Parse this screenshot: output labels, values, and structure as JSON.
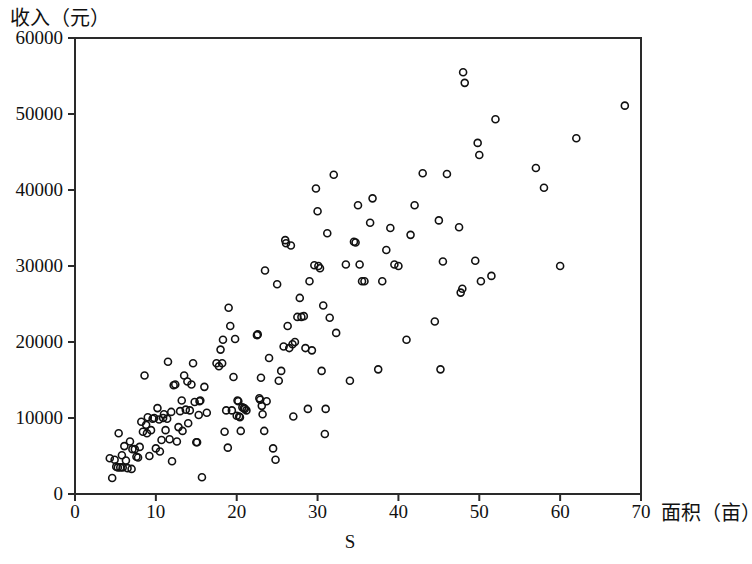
{
  "chart_data": {
    "type": "scatter",
    "title": "",
    "subtitle": "",
    "xlabel": "面积（亩）",
    "ylabel": "收入（元）",
    "series_label": "S",
    "xlim": [
      0,
      70
    ],
    "ylim": [
      0,
      60000
    ],
    "xticks": [
      0,
      10,
      20,
      30,
      40,
      50,
      60,
      70
    ],
    "yticks": [
      0,
      10000,
      20000,
      30000,
      40000,
      50000,
      60000
    ],
    "xtick_labels": [
      "0",
      "10",
      "20",
      "30",
      "40",
      "50",
      "60",
      "70"
    ],
    "ytick_labels": [
      "0",
      "10000",
      "20000",
      "30000",
      "40000",
      "50000",
      "60000"
    ],
    "grid": false,
    "legend": null,
    "marker": "open-circle",
    "marker_color": "#111111",
    "marker_size": 7,
    "n_points": 196,
    "points": [
      [
        4.3,
        4700
      ],
      [
        4.6,
        2100
      ],
      [
        4.9,
        4500
      ],
      [
        5.1,
        3600
      ],
      [
        5.3,
        3500
      ],
      [
        5.4,
        8000
      ],
      [
        5.6,
        3500
      ],
      [
        5.8,
        5100
      ],
      [
        5.9,
        3500
      ],
      [
        6.1,
        6300
      ],
      [
        6.3,
        4400
      ],
      [
        6.5,
        3400
      ],
      [
        6.8,
        6900
      ],
      [
        7.0,
        3300
      ],
      [
        7.1,
        5900
      ],
      [
        7.4,
        5900
      ],
      [
        7.6,
        4900
      ],
      [
        7.8,
        4800
      ],
      [
        8.0,
        6200
      ],
      [
        8.2,
        9500
      ],
      [
        8.4,
        8200
      ],
      [
        8.6,
        15600
      ],
      [
        8.8,
        9100
      ],
      [
        8.9,
        8000
      ],
      [
        9.0,
        10100
      ],
      [
        9.2,
        5000
      ],
      [
        9.4,
        8400
      ],
      [
        9.6,
        9900
      ],
      [
        9.8,
        10000
      ],
      [
        10.0,
        6000
      ],
      [
        10.2,
        11300
      ],
      [
        10.4,
        9800
      ],
      [
        10.5,
        5600
      ],
      [
        10.7,
        7100
      ],
      [
        10.9,
        10000
      ],
      [
        11.0,
        10500
      ],
      [
        11.2,
        8400
      ],
      [
        11.4,
        9900
      ],
      [
        11.5,
        17400
      ],
      [
        11.7,
        7200
      ],
      [
        11.9,
        10800
      ],
      [
        12.0,
        4300
      ],
      [
        12.2,
        14300
      ],
      [
        12.4,
        14400
      ],
      [
        12.6,
        6900
      ],
      [
        12.8,
        8800
      ],
      [
        13.0,
        10900
      ],
      [
        13.2,
        12300
      ],
      [
        13.3,
        8300
      ],
      [
        13.5,
        15600
      ],
      [
        13.7,
        11100
      ],
      [
        13.9,
        14800
      ],
      [
        14.0,
        9300
      ],
      [
        14.2,
        11000
      ],
      [
        14.4,
        14400
      ],
      [
        14.6,
        17200
      ],
      [
        14.8,
        12100
      ],
      [
        15.0,
        6800
      ],
      [
        15.1,
        6800
      ],
      [
        15.3,
        10400
      ],
      [
        15.4,
        12200
      ],
      [
        15.5,
        12300
      ],
      [
        15.7,
        2200
      ],
      [
        16.0,
        14100
      ],
      [
        16.3,
        10700
      ],
      [
        17.5,
        17200
      ],
      [
        17.8,
        16800
      ],
      [
        18.0,
        19000
      ],
      [
        18.2,
        17200
      ],
      [
        18.3,
        20300
      ],
      [
        18.5,
        8200
      ],
      [
        18.7,
        11000
      ],
      [
        18.9,
        6100
      ],
      [
        19.0,
        24500
      ],
      [
        19.2,
        22100
      ],
      [
        19.4,
        11000
      ],
      [
        19.6,
        15400
      ],
      [
        19.8,
        20400
      ],
      [
        20.0,
        10300
      ],
      [
        20.1,
        12300
      ],
      [
        20.2,
        12200
      ],
      [
        20.3,
        10200
      ],
      [
        20.4,
        10100
      ],
      [
        20.5,
        8300
      ],
      [
        20.7,
        11400
      ],
      [
        20.9,
        11300
      ],
      [
        21.0,
        11200
      ],
      [
        21.2,
        11000
      ],
      [
        22.5,
        20900
      ],
      [
        22.6,
        21000
      ],
      [
        22.8,
        12600
      ],
      [
        22.9,
        12400
      ],
      [
        23.0,
        15300
      ],
      [
        23.1,
        11600
      ],
      [
        23.2,
        10500
      ],
      [
        23.4,
        8300
      ],
      [
        23.5,
        29400
      ],
      [
        23.7,
        12200
      ],
      [
        24.0,
        17900
      ],
      [
        24.5,
        6000
      ],
      [
        24.8,
        4500
      ],
      [
        25.0,
        27600
      ],
      [
        25.2,
        14900
      ],
      [
        25.5,
        16200
      ],
      [
        25.8,
        19400
      ],
      [
        26.0,
        33400
      ],
      [
        26.1,
        33000
      ],
      [
        26.3,
        22100
      ],
      [
        26.5,
        19200
      ],
      [
        26.7,
        32700
      ],
      [
        26.9,
        19700
      ],
      [
        27.0,
        10200
      ],
      [
        27.2,
        20000
      ],
      [
        27.5,
        23300
      ],
      [
        27.8,
        25800
      ],
      [
        28.0,
        23300
      ],
      [
        28.3,
        23400
      ],
      [
        28.5,
        19200
      ],
      [
        28.8,
        11200
      ],
      [
        29.0,
        28000
      ],
      [
        29.3,
        18900
      ],
      [
        29.6,
        30100
      ],
      [
        29.8,
        40200
      ],
      [
        30.0,
        37200
      ],
      [
        30.1,
        30000
      ],
      [
        30.3,
        29700
      ],
      [
        30.5,
        16200
      ],
      [
        30.7,
        24800
      ],
      [
        30.9,
        7900
      ],
      [
        31.0,
        11200
      ],
      [
        31.2,
        34300
      ],
      [
        31.5,
        23200
      ],
      [
        32.0,
        42000
      ],
      [
        32.3,
        21200
      ],
      [
        33.5,
        30200
      ],
      [
        34.0,
        14900
      ],
      [
        34.5,
        33200
      ],
      [
        34.7,
        33100
      ],
      [
        35.0,
        38000
      ],
      [
        35.2,
        30200
      ],
      [
        35.5,
        28000
      ],
      [
        35.8,
        28000
      ],
      [
        36.5,
        35700
      ],
      [
        36.8,
        38900
      ],
      [
        37.5,
        16400
      ],
      [
        38.0,
        28000
      ],
      [
        38.5,
        32100
      ],
      [
        39.0,
        35000
      ],
      [
        39.5,
        30200
      ],
      [
        40.0,
        30000
      ],
      [
        41.0,
        20300
      ],
      [
        41.5,
        34100
      ],
      [
        42.0,
        38000
      ],
      [
        43.0,
        42200
      ],
      [
        44.5,
        22700
      ],
      [
        45.0,
        36000
      ],
      [
        45.2,
        16400
      ],
      [
        45.5,
        30600
      ],
      [
        46.0,
        42100
      ],
      [
        47.5,
        35100
      ],
      [
        47.7,
        26500
      ],
      [
        47.9,
        27000
      ],
      [
        48.0,
        55500
      ],
      [
        48.2,
        54100
      ],
      [
        49.5,
        30700
      ],
      [
        49.8,
        46200
      ],
      [
        50.0,
        44600
      ],
      [
        50.2,
        28000
      ],
      [
        51.5,
        28700
      ],
      [
        52.0,
        49300
      ],
      [
        57.0,
        42900
      ],
      [
        58.0,
        40300
      ],
      [
        60.0,
        30000
      ],
      [
        62.0,
        46800
      ],
      [
        68.0,
        51100
      ]
    ]
  },
  "axes": {
    "y_title": "收入（元）",
    "x_title": "面积（亩）",
    "series_name": "S"
  }
}
